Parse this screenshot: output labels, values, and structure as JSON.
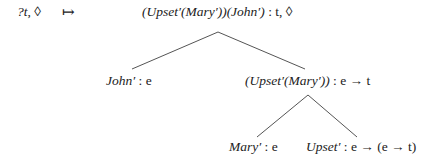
{
  "diagram": {
    "type": "semantic-derivation-tree",
    "left_node": {
      "label_var": "?t",
      "label_sep": ", ",
      "label_diamond": "◊"
    },
    "maps_to": "↦",
    "root": {
      "formula": "(Upset′(Mary′))(John′)",
      "type": " : t, ◊"
    },
    "nodes": [
      {
        "id": "john",
        "formula": "John′",
        "type": " : e"
      },
      {
        "id": "vp",
        "formula": "(Upset′(Mary′))",
        "type": " : e → t"
      },
      {
        "id": "mary",
        "formula": "Mary′",
        "type": " : e"
      },
      {
        "id": "upset",
        "formula": "Upset′",
        "type": " : e → (e → t)"
      }
    ],
    "edges": [
      {
        "from": "root",
        "to": "john"
      },
      {
        "from": "root",
        "to": "vp"
      },
      {
        "from": "vp",
        "to": "mary"
      },
      {
        "from": "vp",
        "to": "upset"
      }
    ]
  }
}
